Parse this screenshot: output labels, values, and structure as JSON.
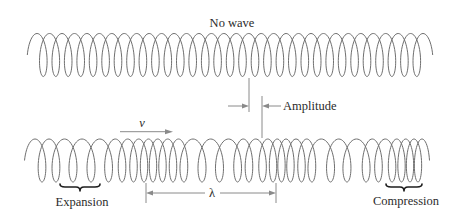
{
  "diagram": {
    "title_label": "No wave",
    "labels": {
      "amplitude": "Amplitude",
      "velocity": "v",
      "wavelength": "λ",
      "expansion": "Expansion",
      "compression": "Compression"
    },
    "colors": {
      "background": "#ffffff",
      "coil": "#6f6f6f",
      "guides": "#8a8a8a",
      "text": "#2b2b2b",
      "braces": "#1e1e1e"
    },
    "coils": {
      "no_wave": {
        "center_y": 55,
        "radius": 21.5,
        "loop_centers_x": [
          43.3,
          55.8,
          68.2,
          80.7,
          93.1,
          105.6,
          118.0,
          130.5,
          142.9,
          155.4,
          167.8,
          180.3,
          192.7,
          205.2,
          217.6,
          230.1,
          242.5,
          255.0,
          267.4,
          279.9,
          292.3,
          304.8,
          317.2,
          329.7,
          342.1,
          354.6,
          367.0,
          379.5,
          391.9,
          404.4,
          416.8
        ]
      },
      "longitudinal_wave": {
        "center_y": 160.5,
        "radius": 21.5,
        "loop_centers_x": [
          42,
          56,
          73,
          91,
          108.5,
          122,
          133.5,
          144,
          153,
          162.5,
          173,
          184,
          202,
          219.5,
          237.5,
          249,
          262.5,
          273,
          281.5,
          290.5,
          301.5,
          312,
          330.5,
          347,
          366,
          378.5,
          392,
          401.5,
          410,
          418
        ]
      }
    }
  }
}
